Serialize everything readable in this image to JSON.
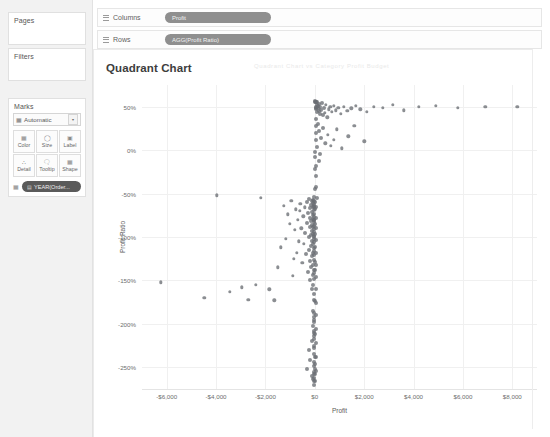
{
  "app": {
    "background": "#ffffff",
    "sidebar_bg": "#f2f2f2"
  },
  "sidebar": {
    "pages": {
      "title": "Pages"
    },
    "filters": {
      "title": "Filters"
    },
    "marks": {
      "title": "Marks",
      "type_dropdown": {
        "label": "Automatic",
        "icon": "marks-type-icon",
        "caret": "▾"
      },
      "buttons": [
        {
          "label": "Color",
          "icon": "color-icon",
          "glyph": "░"
        },
        {
          "label": "Size",
          "icon": "size-icon",
          "glyph": "◯"
        },
        {
          "label": "Label",
          "icon": "label-icon",
          "glyph": "▣"
        },
        {
          "label": "Detail",
          "icon": "detail-icon",
          "glyph": "∴"
        },
        {
          "label": "Tooltip",
          "icon": "tooltip-icon",
          "glyph": "⬜"
        },
        {
          "label": "Shape",
          "icon": "shape-icon",
          "glyph": "░"
        }
      ],
      "pill": {
        "label": "YEAR(Order...",
        "page_glyph": "▤",
        "handle": "░"
      }
    }
  },
  "shelves": [
    {
      "name": "Columns",
      "pill": "Profit"
    },
    {
      "name": "Rows",
      "pill": "AGG(Profit Ratio)"
    }
  ],
  "worksheet": {
    "title": "Quadrant Chart",
    "ghost_text": "Quadrant Chart vs Category   Profit   Budget"
  },
  "chart_data": {
    "type": "scatter",
    "title": "Quadrant Chart",
    "xlabel": "Profit",
    "ylabel": "Profit Ratio",
    "xlim": [
      -7000,
      9000
    ],
    "ylim": [
      -2.75,
      0.75
    ],
    "grid": true,
    "legend": "none",
    "mark_color": "#6a6e73",
    "xticks": [
      -6000,
      -4000,
      -2000,
      0,
      2000,
      4000,
      6000,
      8000
    ],
    "xticklabels": [
      "-$6,000",
      "-$4,000",
      "-$2,000",
      "$0",
      "$2,000",
      "$4,000",
      "$6,000",
      "$8,000"
    ],
    "yticks": [
      0.5,
      0.0,
      -0.5,
      -1.0,
      -1.5,
      -2.0,
      -2.5
    ],
    "yticklabels": [
      "50%",
      "0%",
      "-50%",
      "-100%",
      "-150%",
      "-200%",
      "-250%"
    ],
    "series": [
      {
        "name": "Marks",
        "points": [
          [
            -6250,
            -1.52
          ],
          [
            -4480,
            -1.7
          ],
          [
            -3980,
            -0.52
          ],
          [
            -3450,
            -1.63
          ],
          [
            -2950,
            -1.58
          ],
          [
            -2700,
            -1.72
          ],
          [
            -2380,
            -1.55
          ],
          [
            -2200,
            -0.55
          ],
          [
            -1850,
            -1.6
          ],
          [
            -1640,
            -1.73
          ],
          [
            -1500,
            -1.35
          ],
          [
            -1380,
            -1.12
          ],
          [
            -1250,
            -0.64
          ],
          [
            -1180,
            -1.02
          ],
          [
            -1100,
            -0.74
          ],
          [
            -1020,
            -0.85
          ],
          [
            -960,
            -0.58
          ],
          [
            -900,
            -1.45
          ],
          [
            -860,
            -1.25
          ],
          [
            -820,
            -0.92
          ],
          [
            -780,
            -0.68
          ],
          [
            -740,
            -1.18
          ],
          [
            -700,
            -0.8
          ],
          [
            -660,
            -1.05
          ],
          [
            -620,
            -0.7
          ],
          [
            -580,
            -0.62
          ],
          [
            -540,
            -0.9
          ],
          [
            -500,
            -1.3
          ],
          [
            -470,
            -0.76
          ],
          [
            -440,
            -1.08
          ],
          [
            -410,
            -0.66
          ],
          [
            -380,
            -0.95
          ],
          [
            -350,
            -1.2
          ],
          [
            -330,
            -0.6
          ],
          [
            -310,
            -0.84
          ],
          [
            -290,
            -1.4
          ],
          [
            -270,
            -0.72
          ],
          [
            -255,
            -1.0
          ],
          [
            -240,
            -0.56
          ],
          [
            -228,
            -1.15
          ],
          [
            -215,
            -0.88
          ],
          [
            -205,
            -0.67
          ],
          [
            -195,
            -1.28
          ],
          [
            -185,
            -0.78
          ],
          [
            -175,
            -1.5
          ],
          [
            -165,
            -0.63
          ],
          [
            -158,
            -0.98
          ],
          [
            -150,
            -1.1
          ],
          [
            -143,
            -0.82
          ],
          [
            -137,
            -1.35
          ],
          [
            -130,
            -0.59
          ],
          [
            -124,
            -0.93
          ],
          [
            -118,
            -1.22
          ],
          [
            -112,
            -0.71
          ],
          [
            -107,
            -1.6
          ],
          [
            -102,
            -0.86
          ],
          [
            -97,
            -1.05
          ],
          [
            -93,
            -0.65
          ],
          [
            -89,
            -1.44
          ],
          [
            -85,
            -0.79
          ],
          [
            -81,
            -1.18
          ],
          [
            -77,
            -0.57
          ],
          [
            -74,
            -0.96
          ],
          [
            -70,
            -1.32
          ],
          [
            -67,
            -0.75
          ],
          [
            -64,
            -1.08
          ],
          [
            -61,
            -0.61
          ],
          [
            -58,
            -0.89
          ],
          [
            -55,
            -1.55
          ],
          [
            -52,
            -0.83
          ],
          [
            -50,
            -1.02
          ],
          [
            -47,
            -0.69
          ],
          [
            -45,
            -1.26
          ],
          [
            -43,
            -0.54
          ],
          [
            -41,
            -0.91
          ],
          [
            -39,
            -1.42
          ],
          [
            -37,
            -0.77
          ],
          [
            -35,
            -1.13
          ],
          [
            -33,
            -0.64
          ],
          [
            -31,
            -0.99
          ],
          [
            -30,
            -1.66
          ],
          [
            -28,
            -0.81
          ],
          [
            -27,
            -1.21
          ],
          [
            -25,
            -0.58
          ],
          [
            -24,
            -0.94
          ],
          [
            -23,
            -1.38
          ],
          [
            -22,
            -0.73
          ],
          [
            -21,
            -1.06
          ],
          [
            -20,
            -0.62
          ],
          [
            -19,
            -0.87
          ],
          [
            -18,
            -1.48
          ],
          [
            -17,
            -0.8
          ],
          [
            -16,
            -1.16
          ],
          [
            -15,
            -0.66
          ],
          [
            -14,
            -1.0
          ],
          [
            -13,
            -1.72
          ],
          [
            -12,
            -0.85
          ],
          [
            -11,
            -1.29
          ],
          [
            -10,
            -0.6
          ],
          [
            -9,
            -0.97
          ],
          [
            -60,
            -1.85
          ],
          [
            -55,
            -2.02
          ],
          [
            -48,
            -1.92
          ],
          [
            -42,
            -2.14
          ],
          [
            -38,
            -1.98
          ],
          [
            -35,
            -2.26
          ],
          [
            -30,
            -2.08
          ],
          [
            -28,
            -1.88
          ],
          [
            -25,
            -2.35
          ],
          [
            -22,
            -2.18
          ],
          [
            -20,
            -1.95
          ],
          [
            -18,
            -2.44
          ],
          [
            -16,
            -2.28
          ],
          [
            -14,
            -2.1
          ],
          [
            -12,
            -2.52
          ],
          [
            -10,
            -2.38
          ],
          [
            -45,
            -2.58
          ],
          [
            -30,
            -2.62
          ],
          [
            -20,
            -2.55
          ],
          [
            -15,
            -2.66
          ],
          [
            -36,
            -2.7
          ],
          [
            -24,
            -2.48
          ],
          [
            -250,
            -2.3
          ],
          [
            -180,
            -2.42
          ],
          [
            -120,
            -2.2
          ],
          [
            -95,
            -2.6
          ],
          [
            -70,
            -2.64
          ],
          [
            -300,
            -2.52
          ],
          [
            30,
            0.48
          ],
          [
            45,
            0.5
          ],
          [
            60,
            0.47
          ],
          [
            75,
            0.52
          ],
          [
            90,
            0.44
          ],
          [
            110,
            0.49
          ],
          [
            130,
            0.51
          ],
          [
            150,
            0.45
          ],
          [
            175,
            0.53
          ],
          [
            200,
            0.42
          ],
          [
            230,
            0.5
          ],
          [
            260,
            0.46
          ],
          [
            290,
            0.54
          ],
          [
            320,
            0.41
          ],
          [
            360,
            0.49
          ],
          [
            400,
            0.43
          ],
          [
            450,
            0.52
          ],
          [
            500,
            0.38
          ],
          [
            560,
            0.47
          ],
          [
            620,
            0.5
          ],
          [
            700,
            0.44
          ],
          [
            780,
            0.51
          ],
          [
            860,
            0.46
          ],
          [
            950,
            0.49
          ],
          [
            1050,
            0.42
          ],
          [
            1180,
            0.5
          ],
          [
            1320,
            0.45
          ],
          [
            1480,
            0.48
          ],
          [
            1650,
            0.51
          ],
          [
            1850,
            0.47
          ],
          [
            2100,
            0.44
          ],
          [
            2400,
            0.5
          ],
          [
            2750,
            0.49
          ],
          [
            3150,
            0.52
          ],
          [
            3600,
            0.46
          ],
          [
            4200,
            0.5
          ],
          [
            4900,
            0.51
          ],
          [
            5800,
            0.49
          ],
          [
            6900,
            0.5
          ],
          [
            8200,
            0.5
          ],
          [
            120,
            0.3
          ],
          [
            180,
            0.22
          ],
          [
            260,
            0.14
          ],
          [
            340,
            0.26
          ],
          [
            430,
            0.08
          ],
          [
            520,
            0.18
          ],
          [
            640,
            0.05
          ],
          [
            760,
            0.12
          ],
          [
            900,
            0.24
          ],
          [
            1100,
            0.02
          ],
          [
            1350,
            0.16
          ],
          [
            1600,
            0.28
          ],
          [
            2000,
            0.1
          ],
          [
            150,
            -0.12
          ],
          [
            220,
            -0.05
          ],
          [
            30,
            0.36
          ],
          [
            42,
            0.28
          ],
          [
            55,
            0.2
          ],
          [
            68,
            0.12
          ],
          [
            80,
            0.04
          ],
          [
            25,
            -0.08
          ],
          [
            38,
            -0.18
          ],
          [
            50,
            -0.3
          ],
          [
            62,
            -0.42
          ],
          [
            74,
            -0.55
          ],
          [
            28,
            -0.66
          ],
          [
            40,
            -0.78
          ],
          [
            52,
            -0.9
          ],
          [
            64,
            -1.04
          ],
          [
            33,
            -1.18
          ],
          [
            45,
            -1.32
          ],
          [
            57,
            -1.46
          ],
          [
            36,
            -1.6
          ],
          [
            48,
            -1.76
          ],
          [
            29,
            -1.9
          ],
          [
            41,
            -2.06
          ],
          [
            53,
            -2.22
          ],
          [
            34,
            -2.38
          ],
          [
            46,
            -2.54
          ],
          [
            27,
            -2.66
          ],
          [
            18,
            0.55
          ],
          [
            22,
            0.57
          ],
          [
            35,
            0.56
          ],
          [
            48,
            0.55
          ],
          [
            70,
            0.56
          ],
          [
            15,
            -0.02
          ],
          [
            12,
            -0.22
          ],
          [
            9,
            -0.45
          ],
          [
            14,
            -0.68
          ],
          [
            11,
            -1.12
          ],
          [
            16,
            -1.38
          ],
          [
            13,
            -1.74
          ],
          [
            10,
            -2.12
          ],
          [
            17,
            -2.46
          ],
          [
            8,
            -2.58
          ]
        ]
      }
    ]
  }
}
